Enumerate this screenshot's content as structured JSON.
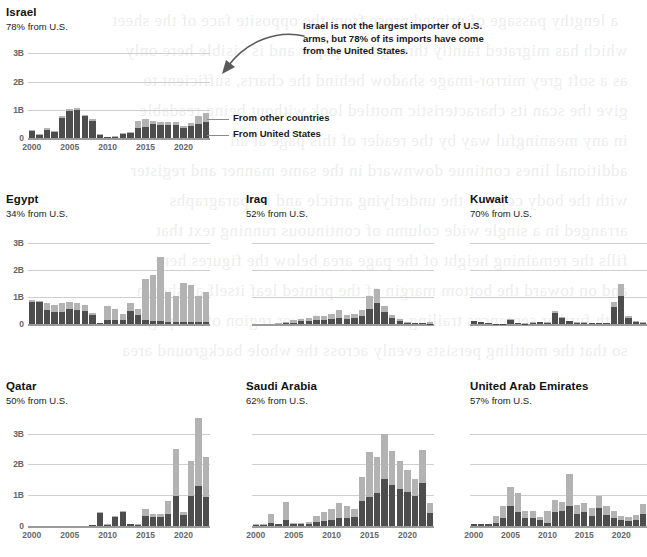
{
  "figure": {
    "legend": {
      "other_label": "From other countries",
      "us_label": "From United States"
    },
    "annotation": "Israel is not the largest importer of U.S. arms, but 78% of its imports have come from the United States.",
    "colors": {
      "other": "#b3b3b3",
      "us": "#4d4d4d",
      "gridline": "#cfcfcf",
      "axis_text": "#666666",
      "title": "#111111"
    },
    "ghost_text": "a blurred mirror image of body text bleeding through from the reverse side of the printed page"
  },
  "chart_data": [
    {
      "type": "bar",
      "title": "Israel",
      "subtitle": "78% from U.S.",
      "xlabel": "",
      "ylabel": "",
      "ylim": [
        0,
        3.4
      ],
      "ytick_labels": [
        "3B",
        "2B",
        "1B",
        "0"
      ],
      "ytick_values": [
        3,
        2,
        1,
        0
      ],
      "xtick_labels": [
        "2000",
        "2005",
        "2010",
        "2015",
        "2020"
      ],
      "xtick_values": [
        2000,
        2005,
        2010,
        2015,
        2020
      ],
      "grid": true,
      "legend_position": "right",
      "stacked": true,
      "x": [
        2000,
        2001,
        2002,
        2003,
        2004,
        2005,
        2006,
        2007,
        2008,
        2009,
        2010,
        2011,
        2012,
        2013,
        2014,
        2015,
        2016,
        2017,
        2018,
        2019,
        2020,
        2021,
        2022,
        2023
      ],
      "series": [
        {
          "name": "From United States",
          "values": [
            0.26,
            0.12,
            0.3,
            0.22,
            0.72,
            0.96,
            1.0,
            0.78,
            0.62,
            0.12,
            0.03,
            0.05,
            0.14,
            0.16,
            0.34,
            0.39,
            0.5,
            0.47,
            0.46,
            0.46,
            0.34,
            0.42,
            0.5,
            0.58
          ]
        },
        {
          "name": "From other countries",
          "values": [
            0.04,
            0.04,
            0.04,
            0.03,
            0.06,
            0.08,
            0.08,
            0.05,
            0.05,
            0.02,
            0.02,
            0.02,
            0.04,
            0.06,
            0.25,
            0.3,
            0.12,
            0.1,
            0.1,
            0.1,
            0.08,
            0.1,
            0.28,
            0.32
          ]
        }
      ]
    },
    {
      "type": "bar",
      "title": "Egypt",
      "subtitle": "34% from U.S.",
      "xlabel": "",
      "ylabel": "",
      "ylim": [
        0,
        3.4
      ],
      "ytick_labels": [
        "3B",
        "2B",
        "1B",
        "0"
      ],
      "ytick_values": [
        3,
        2,
        1,
        0
      ],
      "xtick_labels": [
        "2000",
        "2005",
        "2010",
        "2015",
        "2020"
      ],
      "xtick_values": [
        2000,
        2005,
        2010,
        2015,
        2020
      ],
      "grid": true,
      "legend_position": "none",
      "stacked": true,
      "x": [
        2000,
        2001,
        2002,
        2003,
        2004,
        2005,
        2006,
        2007,
        2008,
        2009,
        2010,
        2011,
        2012,
        2013,
        2014,
        2015,
        2016,
        2017,
        2018,
        2019,
        2020,
        2021,
        2022,
        2023
      ],
      "series": [
        {
          "name": "From United States",
          "values": [
            0.82,
            0.8,
            0.52,
            0.44,
            0.46,
            0.55,
            0.52,
            0.48,
            0.32,
            0.02,
            0.16,
            0.14,
            0.16,
            0.48,
            0.32,
            0.13,
            0.1,
            0.1,
            0.09,
            0.07,
            0.07,
            0.06,
            0.08,
            0.07
          ]
        },
        {
          "name": "From other countries",
          "values": [
            0.06,
            0.06,
            0.26,
            0.26,
            0.3,
            0.28,
            0.24,
            0.22,
            0.1,
            0.03,
            0.5,
            0.42,
            0.2,
            0.28,
            0.22,
            1.52,
            1.7,
            2.38,
            1.1,
            0.95,
            1.45,
            1.4,
            0.95,
            1.12
          ]
        }
      ]
    },
    {
      "type": "bar",
      "title": "Iraq",
      "subtitle": "52% from U.S.",
      "xlabel": "",
      "ylabel": "",
      "ylim": [
        0,
        3.4
      ],
      "ytick_labels": [
        "3B",
        "2B",
        "1B",
        "0"
      ],
      "ytick_values": [
        3,
        2,
        1,
        0
      ],
      "xtick_labels": [
        "2000",
        "2005",
        "2010",
        "2015",
        "2020"
      ],
      "xtick_values": [
        2000,
        2005,
        2010,
        2015,
        2020
      ],
      "grid": true,
      "legend_position": "none",
      "stacked": true,
      "x": [
        2000,
        2001,
        2002,
        2003,
        2004,
        2005,
        2006,
        2007,
        2008,
        2009,
        2010,
        2011,
        2012,
        2013,
        2014,
        2015,
        2016,
        2017,
        2018,
        2019,
        2020,
        2021,
        2022,
        2023
      ],
      "series": [
        {
          "name": "From United States",
          "values": [
            0.0,
            0.0,
            0.0,
            0.0,
            0.03,
            0.05,
            0.1,
            0.12,
            0.14,
            0.16,
            0.2,
            0.22,
            0.18,
            0.22,
            0.3,
            0.55,
            0.78,
            0.45,
            0.22,
            0.1,
            0.05,
            0.03,
            0.02,
            0.01
          ]
        },
        {
          "name": "From other countries",
          "values": [
            0.0,
            0.0,
            0.0,
            0.02,
            0.05,
            0.1,
            0.08,
            0.1,
            0.14,
            0.14,
            0.18,
            0.3,
            0.14,
            0.16,
            0.2,
            0.5,
            0.52,
            0.2,
            0.1,
            0.08,
            0.04,
            0.02,
            0.02,
            0.06
          ]
        }
      ]
    },
    {
      "type": "bar",
      "title": "Kuwait",
      "subtitle": "70% from U.S.",
      "xlabel": "",
      "ylabel": "",
      "ylim": [
        0,
        3.4
      ],
      "ytick_labels": [
        "3B",
        "2B",
        "1B",
        "0"
      ],
      "ytick_values": [
        3,
        2,
        1,
        0
      ],
      "xtick_labels": [
        "2000",
        "2005",
        "2010",
        "2015",
        "2020"
      ],
      "xtick_values": [
        2000,
        2005,
        2010,
        2015,
        2020
      ],
      "grid": true,
      "legend_position": "none",
      "stacked": true,
      "x": [
        2000,
        2001,
        2002,
        2003,
        2004,
        2005,
        2006,
        2007,
        2008,
        2009,
        2010,
        2011,
        2012,
        2013,
        2014,
        2015,
        2016,
        2017,
        2018,
        2019,
        2020,
        2021,
        2022,
        2023
      ],
      "series": [
        {
          "name": "From United States",
          "values": [
            0.11,
            0.06,
            0.03,
            0.01,
            0.01,
            0.16,
            0.02,
            0.01,
            0.05,
            0.06,
            0.04,
            0.4,
            0.22,
            0.1,
            0.05,
            0.04,
            0.03,
            0.02,
            0.03,
            0.62,
            1.02,
            0.22,
            0.08,
            0.05
          ]
        },
        {
          "name": "From other countries",
          "values": [
            0.02,
            0.01,
            0.01,
            0.0,
            0.0,
            0.02,
            0.01,
            0.01,
            0.03,
            0.02,
            0.02,
            0.08,
            0.05,
            0.03,
            0.02,
            0.02,
            0.02,
            0.01,
            0.02,
            0.2,
            0.46,
            0.06,
            0.03,
            0.02
          ]
        }
      ]
    },
    {
      "type": "bar",
      "title": "Qatar",
      "subtitle": "50% from U.S.",
      "xlabel": "",
      "ylabel": "",
      "ylim": [
        0,
        3.6
      ],
      "ytick_labels": [
        "3B",
        "2B",
        "1B",
        "0"
      ],
      "ytick_values": [
        3,
        2,
        1,
        0
      ],
      "xtick_labels": [
        "2000",
        "2005",
        "2010",
        "2015",
        "2020"
      ],
      "xtick_values": [
        2000,
        2005,
        2010,
        2015,
        2020
      ],
      "grid": true,
      "legend_position": "none",
      "stacked": true,
      "x": [
        2000,
        2001,
        2002,
        2003,
        2004,
        2005,
        2006,
        2007,
        2008,
        2009,
        2010,
        2011,
        2012,
        2013,
        2014,
        2015,
        2016,
        2017,
        2018,
        2019,
        2020,
        2021,
        2022,
        2023
      ],
      "series": [
        {
          "name": "From United States",
          "values": [
            0.0,
            0.0,
            0.0,
            0.0,
            0.0,
            0.0,
            0.0,
            0.0,
            0.03,
            0.42,
            0.04,
            0.3,
            0.44,
            0.06,
            0.04,
            0.34,
            0.3,
            0.3,
            0.38,
            0.98,
            0.36,
            0.98,
            1.3,
            0.95
          ]
        },
        {
          "name": "From other countries",
          "values": [
            0.0,
            0.0,
            0.0,
            0.0,
            0.0,
            0.0,
            0.0,
            0.0,
            0.01,
            0.02,
            0.01,
            0.04,
            0.06,
            0.02,
            0.02,
            0.22,
            0.1,
            0.1,
            0.42,
            1.52,
            0.1,
            1.12,
            2.2,
            1.3
          ]
        }
      ]
    },
    {
      "type": "bar",
      "title": "Saudi Arabia",
      "subtitle": "62% from U.S.",
      "xlabel": "",
      "ylabel": "",
      "ylim": [
        0,
        3.6
      ],
      "ytick_labels": [
        "3B",
        "2B",
        "1B",
        "0"
      ],
      "ytick_values": [
        3,
        2,
        1,
        0
      ],
      "xtick_labels": [
        "2000",
        "2005",
        "2010",
        "2015",
        "2020"
      ],
      "xtick_values": [
        2000,
        2005,
        2010,
        2015,
        2020
      ],
      "grid": true,
      "legend_position": "none",
      "stacked": true,
      "x": [
        2000,
        2001,
        2002,
        2003,
        2004,
        2005,
        2006,
        2007,
        2008,
        2009,
        2010,
        2011,
        2012,
        2013,
        2014,
        2015,
        2016,
        2017,
        2018,
        2019,
        2020,
        2021,
        2022,
        2023
      ],
      "series": [
        {
          "name": "From United States",
          "values": [
            0.04,
            0.04,
            0.1,
            0.05,
            0.2,
            0.06,
            0.06,
            0.08,
            0.12,
            0.16,
            0.2,
            0.26,
            0.26,
            0.3,
            0.8,
            0.94,
            1.08,
            1.52,
            1.32,
            1.2,
            1.1,
            0.96,
            1.4,
            0.42
          ]
        },
        {
          "name": "From other countries",
          "values": [
            0.01,
            0.01,
            0.28,
            0.02,
            0.58,
            0.03,
            0.03,
            0.05,
            0.22,
            0.3,
            0.34,
            0.5,
            0.38,
            0.26,
            0.8,
            1.46,
            1.16,
            1.46,
            1.12,
            0.92,
            0.72,
            0.58,
            1.06,
            0.32
          ]
        }
      ]
    },
    {
      "type": "bar",
      "title": "United Arab Emirates",
      "subtitle": "57% from U.S.",
      "xlabel": "",
      "ylabel": "",
      "ylim": [
        0,
        3.6
      ],
      "ytick_labels": [
        "3B",
        "2B",
        "1B",
        "0"
      ],
      "ytick_values": [
        3,
        2,
        1,
        0
      ],
      "xtick_labels": [
        "2000",
        "2005",
        "2010",
        "2015",
        "2020"
      ],
      "xtick_values": [
        2000,
        2005,
        2010,
        2015,
        2020
      ],
      "grid": true,
      "legend_position": "none",
      "stacked": true,
      "x": [
        2000,
        2001,
        2002,
        2003,
        2004,
        2005,
        2006,
        2007,
        2008,
        2009,
        2010,
        2011,
        2012,
        2013,
        2014,
        2015,
        2016,
        2017,
        2018,
        2019,
        2020,
        2021,
        2022,
        2023
      ],
      "series": [
        {
          "name": "From United States",
          "values": [
            0.06,
            0.05,
            0.05,
            0.1,
            0.26,
            0.66,
            0.46,
            0.26,
            0.26,
            0.2,
            0.1,
            0.44,
            0.5,
            0.64,
            0.38,
            0.44,
            0.34,
            0.6,
            0.36,
            0.26,
            0.2,
            0.16,
            0.2,
            0.4
          ]
        },
        {
          "name": "From other countries",
          "values": [
            0.02,
            0.02,
            0.02,
            0.24,
            0.38,
            0.62,
            0.6,
            0.24,
            0.22,
            0.1,
            0.38,
            0.4,
            0.28,
            1.06,
            0.3,
            0.3,
            0.26,
            0.38,
            0.28,
            0.22,
            0.12,
            0.12,
            0.16,
            0.3
          ]
        }
      ]
    }
  ]
}
